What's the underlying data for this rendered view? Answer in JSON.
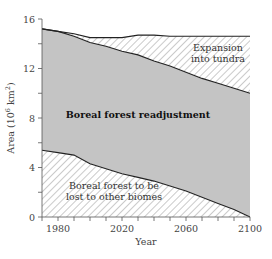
{
  "chart_data": {
    "type": "area",
    "title": "",
    "xlabel": "Year",
    "ylabel": "Area (10^6 km^2)",
    "ylabel_parts": {
      "base": "Area (10",
      "exp1": "6",
      "mid": " km",
      "exp2": "2",
      "end": ")"
    },
    "xlim": [
      1970,
      2100
    ],
    "ylim": [
      0,
      16
    ],
    "x_ticks_major": [
      1980,
      2020,
      2060,
      2100
    ],
    "x_ticks_minor_step": 10,
    "y_ticks_major": [
      0,
      4,
      8,
      12,
      16
    ],
    "y_ticks_minor_step": 2,
    "grid": false,
    "x": [
      1970,
      1980,
      1990,
      2000,
      2010,
      2020,
      2030,
      2040,
      2050,
      2060,
      2070,
      2080,
      2090,
      2100
    ],
    "series": [
      {
        "name": "Total boreal area incl. expansion into tundra (upper boundary)",
        "values": [
          15.2,
          15.0,
          14.8,
          14.5,
          14.5,
          14.5,
          14.7,
          14.7,
          14.6,
          14.6,
          14.6,
          14.6,
          14.6,
          14.6
        ]
      },
      {
        "name": "Existing boreal forest remaining (middle boundary)",
        "values": [
          15.2,
          15.0,
          14.6,
          14.1,
          13.8,
          13.4,
          13.1,
          12.6,
          12.2,
          11.7,
          11.2,
          10.8,
          10.4,
          10.0
        ]
      },
      {
        "name": "Boreal forest to be lost to other biomes (lower boundary)",
        "values": [
          5.4,
          5.2,
          5.0,
          4.3,
          3.9,
          3.5,
          3.2,
          2.9,
          2.5,
          2.1,
          1.6,
          1.1,
          0.6,
          0.0
        ]
      }
    ],
    "regions": [
      {
        "name": "Expansion into tundra",
        "fill": "hatched"
      },
      {
        "name": "Boreal forest readjustment",
        "fill": "#c4c4c4"
      },
      {
        "name": "Boreal forest to be lost to other biomes",
        "fill": "hatched"
      }
    ],
    "annotations": [
      {
        "text_lines": [
          "Expansion",
          "into tundra"
        ],
        "x": 2080,
        "y": 13.4
      },
      {
        "text_lines": [
          "Boreal forest readjustment"
        ],
        "x": 2030,
        "y": 8,
        "bold": true
      },
      {
        "text_lines": [
          "Boreal forest to be",
          "lost to other biomes"
        ],
        "x": 2015,
        "y": 2.3
      }
    ],
    "colors": {
      "gray_fill": "#c4c4c4",
      "hatch": "#8a8a8a",
      "line": "#222222",
      "axis": "#555555"
    }
  }
}
